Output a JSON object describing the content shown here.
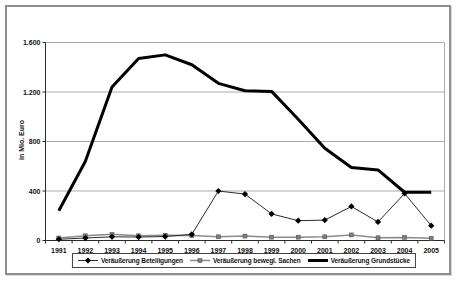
{
  "chart": {
    "y_axis_title": "in Mio. Euro",
    "y_ticks": [
      {
        "label": "0",
        "value": 0
      },
      {
        "label": "400",
        "value": 400
      },
      {
        "label": "800",
        "value": 800
      },
      {
        "label": "1.200",
        "value": 1200
      },
      {
        "label": "1.600",
        "value": 1600
      }
    ],
    "colors": {
      "gridline": "#ababab",
      "axis": "#2b2b2b",
      "frame_border": "#8f8f8f"
    }
  },
  "chart_data": {
    "type": "line",
    "title": "",
    "xlabel": "",
    "ylabel": "in Mio. Euro",
    "ylim": [
      0,
      1600
    ],
    "grid": true,
    "legend_position": "bottom",
    "categories": [
      "1991",
      "1992",
      "1993",
      "1994",
      "1995",
      "1996",
      "1997",
      "1998",
      "1999",
      "2000",
      "2001",
      "2002",
      "2003",
      "2004",
      "2005"
    ],
    "series": [
      {
        "name": "Veräußerung Beteiligungen",
        "marker": "diamond",
        "color": "#2b2b2b",
        "marker_color": "#000000",
        "width": 1,
        "values": [
          10,
          20,
          30,
          28,
          32,
          50,
          400,
          375,
          215,
          160,
          165,
          275,
          150,
          380,
          120
        ]
      },
      {
        "name": "Veräußerung bewegl. Sachen",
        "marker": "square",
        "color": "#8a8a8a",
        "marker_color": "#7d7d7d",
        "marker_edge": "#4d4d4d",
        "width": 1.5,
        "values": [
          20,
          38,
          50,
          38,
          42,
          40,
          30,
          36,
          27,
          27,
          30,
          45,
          22,
          25,
          18
        ]
      },
      {
        "name": "Veräußerung Grundstücke",
        "marker": "none",
        "color": "#000000",
        "width": 3,
        "values": [
          240,
          640,
          1240,
          1470,
          1500,
          1420,
          1270,
          1210,
          1205,
          980,
          745,
          590,
          570,
          390,
          390
        ]
      }
    ]
  }
}
